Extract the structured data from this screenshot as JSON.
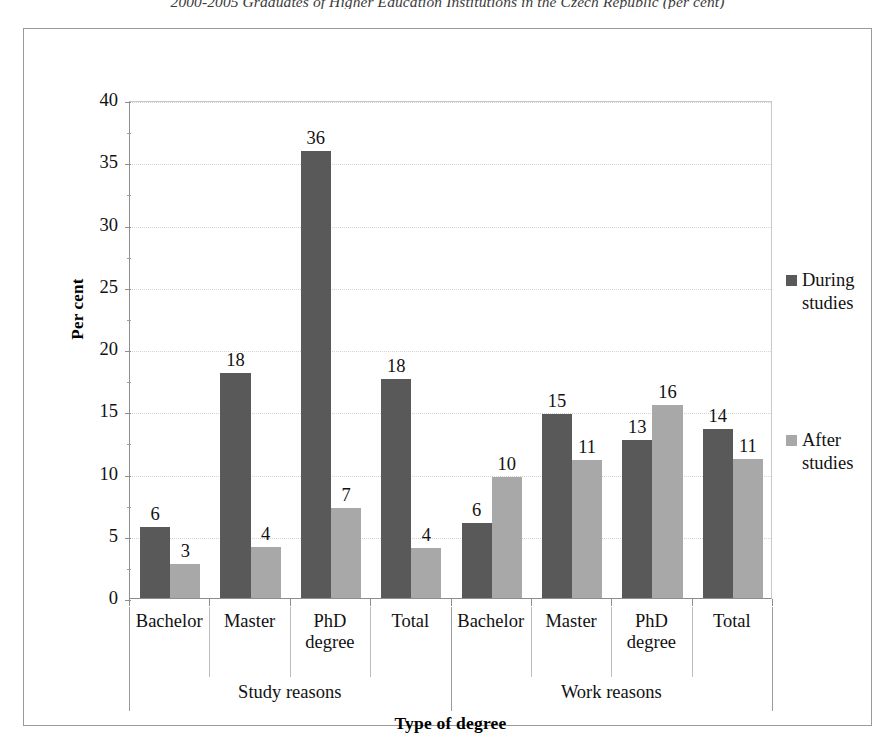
{
  "document": {
    "title": "2000-2005 Graduates of Higher Education Institutions in the Czech Republic (per cent)"
  },
  "chart_data": {
    "type": "bar",
    "title": "",
    "xlabel": "Type of degree",
    "ylabel": "Per cent",
    "ylim": [
      0,
      40
    ],
    "ytick_step": 5,
    "yticks": [
      "40",
      "35",
      "30",
      "25",
      "20",
      "15",
      "10",
      "5",
      "0"
    ],
    "grid": true,
    "legend_position": "right",
    "groups": [
      {
        "name": "Study reasons",
        "categories": [
          "Bachelor",
          "Master",
          "PhD degree",
          "Total"
        ]
      },
      {
        "name": "Work reasons",
        "categories": [
          "Bachelor",
          "Master",
          "PhD degree",
          "Total"
        ]
      }
    ],
    "categories": [
      "Bachelor",
      "Master",
      "PhD degree",
      "Total",
      "Bachelor",
      "Master",
      "PhD degree",
      "Total"
    ],
    "series": [
      {
        "name": "During studies",
        "color": "#595959",
        "values": [
          6,
          18,
          36,
          18,
          6,
          15,
          13,
          14
        ],
        "plotted_heights": [
          5.7,
          18.1,
          35.9,
          17.6,
          6.0,
          14.8,
          12.7,
          13.6
        ],
        "labels": [
          "6",
          "18",
          "36",
          "18",
          "6",
          "15",
          "13",
          "14"
        ]
      },
      {
        "name": "After studies",
        "color": "#a8a8a8",
        "values": [
          3,
          4,
          7,
          4,
          10,
          11,
          16,
          11
        ],
        "plotted_heights": [
          2.7,
          4.1,
          7.2,
          4.0,
          9.7,
          11.1,
          15.5,
          11.2
        ],
        "labels": [
          "3",
          "4",
          "7",
          "4",
          "10",
          "11",
          "16",
          "11"
        ]
      }
    ]
  },
  "legend": {
    "entries": [
      {
        "label": "During studies",
        "swatch": "during-swatch"
      },
      {
        "label": "After studies",
        "swatch": "after-swatch"
      }
    ]
  },
  "colors": {
    "during": "#595959",
    "after": "#a8a8a8",
    "axis": "#8d8d8d",
    "frame": "#9a9a9a",
    "grid": "#d2d2d2"
  }
}
